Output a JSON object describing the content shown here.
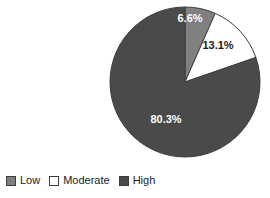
{
  "chart_data": {
    "type": "pie",
    "title": "",
    "subtitle": "",
    "xlabel": "",
    "ylabel": "",
    "grid": false,
    "legend_position": "bottom-left",
    "start_angle_deg": 0,
    "direction": "clockwise",
    "categories": [
      "Low",
      "Moderate",
      "High"
    ],
    "values": [
      6.6,
      13.1,
      80.3
    ],
    "value_unit": "%",
    "data_labels": [
      "6.6%",
      "13.1%",
      "80.3%"
    ],
    "colors": [
      "#808080",
      "#ffffff",
      "#4a4a4a"
    ],
    "label_text_colors": [
      "#ffffff",
      "#1a1a1a",
      "#ffffff"
    ],
    "slice_border_color": "#3d3d3d"
  },
  "legend": {
    "items": [
      {
        "label": "Low",
        "color": "#808080"
      },
      {
        "label": "Moderate",
        "color": "#ffffff"
      },
      {
        "label": "High",
        "color": "#4a4a4a"
      }
    ]
  },
  "pie": {
    "center_x": 77,
    "center_y": 80,
    "radius": 75,
    "slices": [
      {
        "name": "Low",
        "label": "6.6%",
        "label_x": 82,
        "label_y": 17
      },
      {
        "name": "Moderate",
        "label": "13.1%",
        "label_x": 110,
        "label_y": 44
      },
      {
        "name": "High",
        "label": "80.3%",
        "label_x": 58,
        "label_y": 118
      }
    ]
  }
}
